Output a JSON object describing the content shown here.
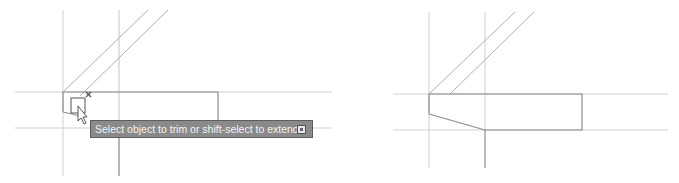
{
  "before_panel": {
    "label": "before-trim",
    "tooltip": {
      "text": "Select object to trim or shift-select to extend or",
      "expand_icon": "options-expand-icon"
    },
    "cursor": {
      "icon": "arrow-cursor-icon",
      "pickbox": "pickbox-square-icon",
      "marker": "x-marker-icon"
    }
  },
  "after_panel": {
    "label": "after-trim"
  },
  "colors": {
    "construction_line": "#c8c8c8",
    "object_line": "#8c8c8c",
    "tooltip_bg": "#8a8a8a",
    "tooltip_text": "#f4f4f4"
  }
}
